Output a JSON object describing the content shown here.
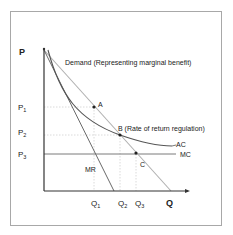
{
  "diagram": {
    "axes": {
      "y_label": "P",
      "x_label": "Q",
      "y_ticks": [
        {
          "label": "P",
          "sub": "1"
        },
        {
          "label": "P",
          "sub": "2"
        },
        {
          "label": "P",
          "sub": "3"
        }
      ],
      "x_ticks": [
        {
          "label": "Q",
          "sub": "1"
        },
        {
          "label": "Q",
          "sub": "2"
        },
        {
          "label": "Q",
          "sub": "3"
        }
      ]
    },
    "curves": {
      "demand": "Demand (Representing marginal benefit)",
      "mr": "MR",
      "ac": "AC",
      "mc": "MC"
    },
    "points": {
      "a": "A",
      "b": "B (Rate of return regulation)",
      "c": "C"
    },
    "colors": {
      "axis": "#333333",
      "demand": "#b0b0b0",
      "mr": "#6a6a6a",
      "ac": "#555555",
      "mc": "#7a7a7a",
      "guide": "#d0d0d0",
      "point": "#222222",
      "frame": "#a8a8a8"
    }
  }
}
